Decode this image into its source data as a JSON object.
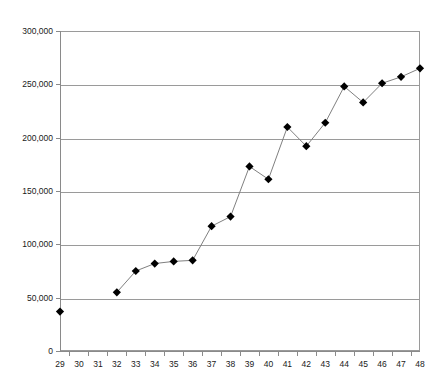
{
  "chart_data": {
    "type": "line",
    "title": "",
    "subtitle": "",
    "xlabel": "",
    "ylabel": "",
    "categories": [
      29,
      30,
      31,
      32,
      33,
      34,
      35,
      36,
      37,
      38,
      39,
      40,
      41,
      42,
      43,
      44,
      45,
      46,
      47,
      48
    ],
    "x_tick_labels": [
      "29",
      "30",
      "31",
      "32",
      "33",
      "34",
      "35",
      "36",
      "37",
      "38",
      "39",
      "40",
      "41",
      "42",
      "43",
      "44",
      "45",
      "46",
      "47",
      "48"
    ],
    "y_tick_labels": [
      "0",
      "50,000",
      "100,000",
      "150,000",
      "200,000",
      "250,000",
      "300,000"
    ],
    "y_tick_values": [
      0,
      50000,
      100000,
      150000,
      200000,
      250000,
      300000
    ],
    "ylim": [
      0,
      300000
    ],
    "y_tick_interval": 50000,
    "grid": "horizontal",
    "legend": "none",
    "marker": "diamond",
    "marker_color": "#000000",
    "line_color": "#808080",
    "plot_background": "#ffffff",
    "gridline_color": "#9a9a9a",
    "series": [
      {
        "name": "Series 1",
        "values": [
          37000,
          null,
          null,
          55000,
          75000,
          82000,
          84000,
          85000,
          117000,
          126000,
          173000,
          161000,
          210000,
          192000,
          214000,
          248000,
          233000,
          251000,
          257000,
          265000
        ]
      }
    ]
  }
}
